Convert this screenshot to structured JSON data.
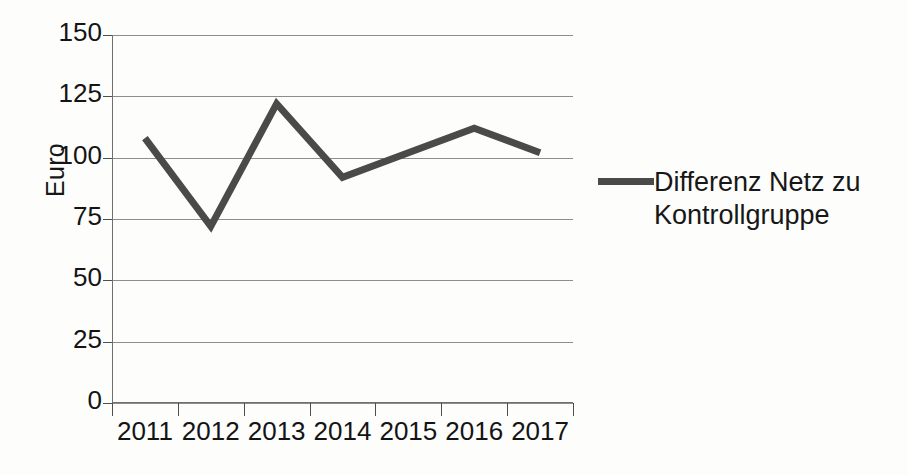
{
  "chart_data": {
    "type": "line",
    "title": "",
    "xlabel": "",
    "ylabel": "Euro",
    "categories": [
      "2011",
      "2012",
      "2013",
      "2014",
      "2015",
      "2016",
      "2017"
    ],
    "series": [
      {
        "name": "Differenz Netz zu Kontrollgruppe",
        "values": [
          108,
          72,
          122,
          92,
          102,
          112,
          102
        ],
        "color": "#4a4a4a"
      }
    ],
    "ylim": [
      0,
      150
    ],
    "y_ticks": [
      0,
      25,
      50,
      75,
      100,
      125,
      150
    ],
    "y_tick_labels": [
      "0",
      "25",
      "50",
      "75",
      "100",
      "125",
      "150"
    ],
    "grid": true,
    "legend_position": "right"
  },
  "legend": {
    "entries": [
      {
        "label": "Differenz Netz zu Kontrollgruppe",
        "color": "#4a4a4a"
      }
    ]
  },
  "colors": {
    "series": "#4a4a4a",
    "gridline": "#8d8d8d",
    "axis": "#6f6f6f",
    "text": "#141414",
    "background": "#fdfdfc"
  }
}
